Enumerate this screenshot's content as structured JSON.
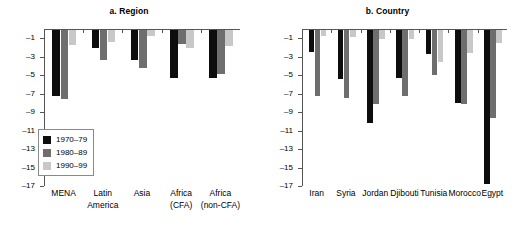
{
  "chart_data": [
    {
      "id": "region",
      "type": "bar",
      "title": "a. Region",
      "xlabel": "",
      "ylabel": "",
      "ylim": [
        -17,
        0
      ],
      "yticks": [
        -1,
        -3,
        -5,
        -7,
        -9,
        -11,
        -13,
        -15,
        -17
      ],
      "grid": false,
      "legend_position": "lower-left",
      "categories": [
        "MENA",
        "Latin America",
        "Asia",
        "Africa (CFA)",
        "Africa (non-CFA)"
      ],
      "category_lines": [
        [
          "MENA"
        ],
        [
          "Latin",
          "America"
        ],
        [
          "Asia"
        ],
        [
          "Africa",
          "(CFA)"
        ],
        [
          "Africa",
          "(non-CFA)"
        ]
      ],
      "series": [
        {
          "name": "1970–79",
          "color": "#0d0d0d",
          "values": [
            -7.2,
            -2.0,
            -3.3,
            -5.2,
            -5.2
          ]
        },
        {
          "name": "1980–89",
          "color": "#6e6e6e",
          "values": [
            -7.5,
            -3.2,
            -4.1,
            -1.5,
            -4.8
          ]
        },
        {
          "name": "1990–99",
          "color": "#c8c8c8",
          "values": [
            -1.6,
            -1.3,
            -0.6,
            -2.0,
            -1.7
          ]
        }
      ]
    },
    {
      "id": "country",
      "type": "bar",
      "title": "b. Country",
      "xlabel": "",
      "ylabel": "",
      "ylim": [
        -17,
        0
      ],
      "yticks": [
        -1,
        -3,
        -5,
        -7,
        -9,
        -11,
        -13,
        -15,
        -17
      ],
      "grid": false,
      "legend_position": "lower-left",
      "categories": [
        "Iran",
        "Syria",
        "Jordan",
        "Djibouti",
        "Tunisia",
        "Morocco",
        "Egypt"
      ],
      "category_lines": [
        [
          "Iran"
        ],
        [
          "Syria"
        ],
        [
          "Jordan"
        ],
        [
          "Djibouti"
        ],
        [
          "Tunisia"
        ],
        [
          "Morocco"
        ],
        [
          "Egypt"
        ]
      ],
      "series": [
        {
          "name": "1970–79",
          "color": "#0d0d0d",
          "values": [
            -2.4,
            -5.3,
            -10.1,
            -5.2,
            -2.6,
            -7.9,
            -16.7
          ]
        },
        {
          "name": "1980–89",
          "color": "#6e6e6e",
          "values": [
            -7.2,
            -7.4,
            -8.0,
            -7.2,
            -4.9,
            -8.0,
            -9.5
          ]
        },
        {
          "name": "1990–99",
          "color": "#c8c8c8",
          "values": [
            -0.6,
            -0.8,
            -1.0,
            -1.0,
            -3.5,
            -2.5,
            -1.4
          ]
        }
      ]
    }
  ],
  "panel_a": {
    "title": "a. Region",
    "ytick_labels": [
      "–1",
      "–3",
      "–5",
      "–7",
      "–9",
      "–11",
      "–13",
      "–15",
      "–17"
    ],
    "legend": [
      {
        "label": "1970–79",
        "color": "#0d0d0d"
      },
      {
        "label": "1980–89",
        "color": "#6e6e6e"
      },
      {
        "label": "1990–99",
        "color": "#c8c8c8"
      }
    ]
  },
  "panel_b": {
    "title": "b. Country",
    "ytick_labels": [
      "–1",
      "–3",
      "–5",
      "–7",
      "–9",
      "–9",
      "–11",
      "–13",
      "–15",
      "–17"
    ],
    "legend": [
      {
        "label": "1970–79",
        "color": "#0d0d0d"
      },
      {
        "label": "1980–89",
        "color": "#6e6e6e"
      },
      {
        "label": "1990–99",
        "color": "#c8c8c8"
      }
    ]
  }
}
